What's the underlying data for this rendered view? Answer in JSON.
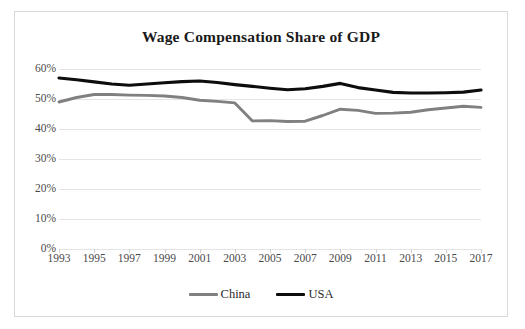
{
  "chart_data": {
    "type": "line",
    "title": "Wage Compensation Share of GDP",
    "xlabel": "",
    "ylabel": "",
    "x": [
      1993,
      1994,
      1995,
      1996,
      1997,
      1998,
      1999,
      2000,
      2001,
      2002,
      2003,
      2004,
      2005,
      2006,
      2007,
      2008,
      2009,
      2010,
      2011,
      2012,
      2013,
      2014,
      2015,
      2016,
      2017
    ],
    "xlim": [
      1993,
      2017
    ],
    "ylim": [
      0,
      60
    ],
    "ytick_labels": [
      "0%",
      "10%",
      "20%",
      "30%",
      "40%",
      "50%",
      "60%"
    ],
    "ytick_values": [
      0,
      10,
      20,
      30,
      40,
      50,
      60
    ],
    "xtick_labels": [
      "1993",
      "1995",
      "1997",
      "1999",
      "2001",
      "2003",
      "2005",
      "2007",
      "2009",
      "2011",
      "2013",
      "2015",
      "2017"
    ],
    "xtick_values": [
      1993,
      1995,
      1997,
      1999,
      2001,
      2003,
      2005,
      2007,
      2009,
      2011,
      2013,
      2015,
      2017
    ],
    "grid": true,
    "legend_position": "bottom",
    "series": [
      {
        "name": "China",
        "color": "#808080",
        "values": [
          49.0,
          50.5,
          51.5,
          51.5,
          51.3,
          51.2,
          51.0,
          50.5,
          49.6,
          49.2,
          48.7,
          42.7,
          42.8,
          42.5,
          42.6,
          44.5,
          46.6,
          46.2,
          45.2,
          45.3,
          45.6,
          46.4,
          47.0,
          47.6,
          47.2
        ]
      },
      {
        "name": "USA",
        "color": "#0d0d0d",
        "values": [
          57.0,
          56.4,
          55.7,
          55.0,
          54.6,
          55.0,
          55.4,
          55.8,
          56.0,
          55.5,
          54.8,
          54.2,
          53.6,
          53.1,
          53.4,
          54.2,
          55.2,
          53.8,
          53.0,
          52.2,
          52.0,
          52.0,
          52.1,
          52.3,
          53.0
        ]
      }
    ]
  },
  "legend": {
    "entries": [
      {
        "label": "China",
        "swatch_name": "legend-swatch-china"
      },
      {
        "label": "USA",
        "swatch_name": "legend-swatch-usa"
      }
    ]
  },
  "colors": {
    "china": "#808080",
    "usa": "#0d0d0d",
    "grid": "#e4e4e4",
    "frame": "#d9d9d9",
    "text": "#4a4a4a",
    "title": "#1a1a1a"
  }
}
